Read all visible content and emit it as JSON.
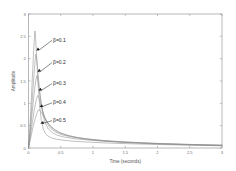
{
  "figure": {
    "background": "#ffffff",
    "frame_color": "#9a9a9a",
    "curve_color": "#8c8c8c",
    "annotation_color": "#1c1c1c"
  },
  "chart_data": {
    "type": "line",
    "title": "",
    "xlabel": "Time  (seconds)",
    "ylabel": "Amplitude",
    "xlim": [
      0,
      3
    ],
    "ylim": [
      0,
      3
    ],
    "xticks": [
      0,
      0.5,
      1,
      1.5,
      2,
      2.5,
      3
    ],
    "xticklabels": [
      "0",
      "0.5",
      "1",
      "1.5",
      "2",
      "2.5",
      "3"
    ],
    "yticks": [
      0,
      0.5,
      1,
      1.5,
      2,
      2.5,
      3
    ],
    "yticklabels": [
      "0",
      "0.5",
      "1",
      "1.5",
      "2",
      "2.5",
      "3"
    ],
    "grid": false,
    "legend": "none",
    "annotations": [
      {
        "text": "β=0.1",
        "label_x": 0.38,
        "label_y": 2.42,
        "point_x": 0.115,
        "point_y": 2.18
      },
      {
        "text": "β=0.2",
        "label_x": 0.38,
        "label_y": 1.92,
        "point_x": 0.135,
        "point_y": 1.7
      },
      {
        "text": "β=0.3",
        "label_x": 0.38,
        "label_y": 1.45,
        "point_x": 0.15,
        "point_y": 1.28
      },
      {
        "text": "β=0.4",
        "label_x": 0.38,
        "label_y": 1.02,
        "point_x": 0.165,
        "point_y": 0.92
      },
      {
        "text": "β=0.5",
        "label_x": 0.38,
        "label_y": 0.62,
        "point_x": 0.18,
        "point_y": 0.55
      }
    ],
    "series": [
      {
        "name": "β=0.1",
        "peak_x": 0.1,
        "peak_y": 2.62,
        "points": [
          [
            0.0,
            0.0
          ],
          [
            0.02,
            0.42
          ],
          [
            0.04,
            0.98
          ],
          [
            0.06,
            1.58
          ],
          [
            0.08,
            2.18
          ],
          [
            0.095,
            2.55
          ],
          [
            0.1,
            2.62
          ],
          [
            0.11,
            2.48
          ],
          [
            0.125,
            2.08
          ],
          [
            0.14,
            1.65
          ],
          [
            0.16,
            1.18
          ],
          [
            0.18,
            0.84
          ],
          [
            0.2,
            0.61
          ],
          [
            0.23,
            0.42
          ],
          [
            0.26,
            0.33
          ],
          [
            0.3,
            0.27
          ],
          [
            0.36,
            0.225
          ],
          [
            0.44,
            0.195
          ],
          [
            0.55,
            0.172
          ],
          [
            0.7,
            0.152
          ],
          [
            0.9,
            0.133
          ],
          [
            1.15,
            0.116
          ],
          [
            1.45,
            0.1
          ],
          [
            1.8,
            0.086
          ],
          [
            2.2,
            0.072
          ],
          [
            2.6,
            0.06
          ],
          [
            3.0,
            0.05
          ]
        ]
      },
      {
        "name": "β=0.2",
        "peak_x": 0.115,
        "peak_y": 2.1,
        "points": [
          [
            0.0,
            0.0
          ],
          [
            0.02,
            0.33
          ],
          [
            0.045,
            0.81
          ],
          [
            0.07,
            1.33
          ],
          [
            0.095,
            1.83
          ],
          [
            0.11,
            2.06
          ],
          [
            0.115,
            2.1
          ],
          [
            0.13,
            1.96
          ],
          [
            0.15,
            1.63
          ],
          [
            0.175,
            1.25
          ],
          [
            0.2,
            0.95
          ],
          [
            0.23,
            0.71
          ],
          [
            0.265,
            0.54
          ],
          [
            0.31,
            0.42
          ],
          [
            0.37,
            0.34
          ],
          [
            0.45,
            0.284
          ],
          [
            0.56,
            0.243
          ],
          [
            0.72,
            0.208
          ],
          [
            0.92,
            0.178
          ],
          [
            1.18,
            0.15
          ],
          [
            1.5,
            0.125
          ],
          [
            1.85,
            0.104
          ],
          [
            2.25,
            0.085
          ],
          [
            2.65,
            0.07
          ],
          [
            3.0,
            0.058
          ]
        ]
      },
      {
        "name": "β=0.3",
        "peak_x": 0.13,
        "peak_y": 1.62,
        "points": [
          [
            0.0,
            0.0
          ],
          [
            0.025,
            0.3
          ],
          [
            0.05,
            0.69
          ],
          [
            0.08,
            1.12
          ],
          [
            0.105,
            1.43
          ],
          [
            0.125,
            1.6
          ],
          [
            0.13,
            1.62
          ],
          [
            0.145,
            1.53
          ],
          [
            0.165,
            1.31
          ],
          [
            0.19,
            1.06
          ],
          [
            0.22,
            0.835
          ],
          [
            0.255,
            0.66
          ],
          [
            0.3,
            0.52
          ],
          [
            0.355,
            0.423
          ],
          [
            0.425,
            0.353
          ],
          [
            0.52,
            0.297
          ],
          [
            0.65,
            0.252
          ],
          [
            0.83,
            0.212
          ],
          [
            1.06,
            0.178
          ],
          [
            1.35,
            0.147
          ],
          [
            1.7,
            0.121
          ],
          [
            2.1,
            0.098
          ],
          [
            2.55,
            0.079
          ],
          [
            3.0,
            0.064
          ]
        ]
      },
      {
        "name": "β=0.4",
        "peak_x": 0.145,
        "peak_y": 1.18,
        "points": [
          [
            0.0,
            0.0
          ],
          [
            0.03,
            0.27
          ],
          [
            0.06,
            0.58
          ],
          [
            0.09,
            0.855
          ],
          [
            0.12,
            1.08
          ],
          [
            0.14,
            1.17
          ],
          [
            0.145,
            1.18
          ],
          [
            0.16,
            1.135
          ],
          [
            0.185,
            1.0
          ],
          [
            0.215,
            0.845
          ],
          [
            0.25,
            0.7
          ],
          [
            0.292,
            0.578
          ],
          [
            0.345,
            0.475
          ],
          [
            0.41,
            0.397
          ],
          [
            0.495,
            0.333
          ],
          [
            0.61,
            0.28
          ],
          [
            0.77,
            0.233
          ],
          [
            0.975,
            0.193
          ],
          [
            1.24,
            0.158
          ],
          [
            1.57,
            0.128
          ],
          [
            1.95,
            0.103
          ],
          [
            2.4,
            0.082
          ],
          [
            2.85,
            0.066
          ],
          [
            3.0,
            0.062
          ]
        ]
      },
      {
        "name": "β=0.5",
        "peak_x": 0.16,
        "peak_y": 0.86,
        "points": [
          [
            0.0,
            0.0
          ],
          [
            0.035,
            0.23
          ],
          [
            0.07,
            0.47
          ],
          [
            0.105,
            0.665
          ],
          [
            0.135,
            0.8
          ],
          [
            0.155,
            0.855
          ],
          [
            0.16,
            0.86
          ],
          [
            0.18,
            0.84
          ],
          [
            0.21,
            0.77
          ],
          [
            0.245,
            0.68
          ],
          [
            0.288,
            0.585
          ],
          [
            0.34,
            0.495
          ],
          [
            0.405,
            0.415
          ],
          [
            0.485,
            0.347
          ],
          [
            0.59,
            0.289
          ],
          [
            0.73,
            0.238
          ],
          [
            0.915,
            0.194
          ],
          [
            1.16,
            0.157
          ],
          [
            1.47,
            0.126
          ],
          [
            1.84,
            0.1
          ],
          [
            2.27,
            0.079
          ],
          [
            2.7,
            0.063
          ],
          [
            3.0,
            0.055
          ]
        ]
      }
    ]
  }
}
